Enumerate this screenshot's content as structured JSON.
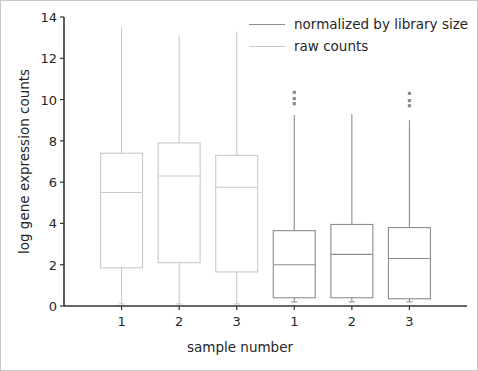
{
  "chart_data": {
    "type": "box",
    "title": "",
    "xlabel": "sample number",
    "ylabel": "log gene expression counts",
    "ylim": [
      0,
      14
    ],
    "yticks": [
      0,
      2,
      4,
      6,
      8,
      10,
      12,
      14
    ],
    "categories": [
      "1",
      "2",
      "3",
      "1",
      "2",
      "3"
    ],
    "grid": false,
    "legend_position": "upper right",
    "legend": [
      {
        "label": "normalized by library size",
        "color": "#8c8c8c"
      },
      {
        "label": "raw counts",
        "color": "#c9c9c9"
      }
    ],
    "series": [
      {
        "name": "raw counts",
        "color": "#c9c9c9",
        "boxes": [
          {
            "category": "1",
            "whisker_low": 0.1,
            "q1": 1.85,
            "median": 5.5,
            "q3": 7.4,
            "whisker_high": 13.5,
            "outliers": []
          },
          {
            "category": "2",
            "whisker_low": 0.1,
            "q1": 2.1,
            "median": 6.3,
            "q3": 7.9,
            "whisker_high": 13.1,
            "outliers": []
          },
          {
            "category": "3",
            "whisker_low": 0.1,
            "q1": 1.65,
            "median": 5.75,
            "q3": 7.3,
            "whisker_high": 13.3,
            "outliers": []
          }
        ]
      },
      {
        "name": "normalized by library size",
        "color": "#8c8c8c",
        "boxes": [
          {
            "category": "1",
            "whisker_low": 0.2,
            "q1": 0.4,
            "median": 2.0,
            "q3": 3.65,
            "whisker_high": 9.25,
            "outliers": [
              9.8,
              10.05,
              10.35
            ]
          },
          {
            "category": "2",
            "whisker_low": 0.2,
            "q1": 0.4,
            "median": 2.5,
            "q3": 3.95,
            "whisker_high": 9.3,
            "outliers": []
          },
          {
            "category": "3",
            "whisker_low": 0.2,
            "q1": 0.35,
            "median": 2.3,
            "q3": 3.8,
            "whisker_high": 9.0,
            "outliers": [
              9.7,
              9.95,
              10.3
            ]
          }
        ]
      }
    ]
  },
  "axis": {
    "y_tick_labels": [
      "0",
      "2",
      "4",
      "6",
      "8",
      "10",
      "12",
      "14"
    ],
    "x_tick_labels": [
      "1",
      "2",
      "3",
      "1",
      "2",
      "3"
    ]
  },
  "colors": {
    "axis_line": "#333333",
    "raw_counts": "#c9c9c9",
    "normalized": "#8c8c8c",
    "frame": "#c8c8c8",
    "text": "#262626"
  }
}
